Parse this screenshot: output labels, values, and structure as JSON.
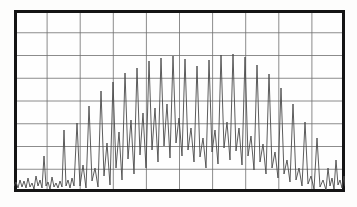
{
  "display": {
    "device_label": "waveform-display",
    "mode": "oscilloscope-trace",
    "background_color": "#fefefe",
    "page_background_color": "#fdfdfc",
    "border_color": "#141414",
    "border_width_px": 3,
    "grid_color": "#6f6f6f",
    "grid_width_px": 0.8,
    "trace_color": "#4a4a4a",
    "trace_width_px": 0.9
  },
  "graticule": {
    "columns": 10,
    "rows": 8,
    "vertical_divisions": 10,
    "horizontal_divisions": 8,
    "show_grid": true,
    "show_border": true,
    "plot_left_px": 14,
    "plot_top_px": 10,
    "plot_width_px": 331,
    "plot_height_px": 182
  },
  "chart_data": {
    "type": "line",
    "title": "",
    "subtitle": "",
    "xlabel": "",
    "ylabel": "",
    "xlim": [
      0,
      331
    ],
    "ylim": [
      0,
      182
    ],
    "grid": true,
    "legend_position": "none",
    "series": [
      {
        "name": "trace",
        "description": "Amplitude-modulated oscillation rising from a noise floor, peaking across the middle of the sweep, then decaying back into the noise floor at the right edge.",
        "baseline_y": 176,
        "points": [
          [
            0,
            176
          ],
          [
            2,
            172
          ],
          [
            4,
            178
          ],
          [
            6,
            170
          ],
          [
            8,
            177
          ],
          [
            10,
            171
          ],
          [
            12,
            178
          ],
          [
            14,
            168
          ],
          [
            16,
            177
          ],
          [
            18,
            173
          ],
          [
            20,
            179
          ],
          [
            22,
            166
          ],
          [
            24,
            176
          ],
          [
            26,
            170
          ],
          [
            28,
            178
          ],
          [
            30,
            146
          ],
          [
            32,
            176
          ],
          [
            34,
            172
          ],
          [
            36,
            179
          ],
          [
            38,
            167
          ],
          [
            40,
            177
          ],
          [
            42,
            173
          ],
          [
            44,
            178
          ],
          [
            46,
            171
          ],
          [
            48,
            177
          ],
          [
            50,
            120
          ],
          [
            52,
            176
          ],
          [
            54,
            170
          ],
          [
            56,
            178
          ],
          [
            58,
            168
          ],
          [
            60,
            176
          ],
          [
            63,
            113
          ],
          [
            66,
            176
          ],
          [
            69,
            155
          ],
          [
            72,
            178
          ],
          [
            75,
            96
          ],
          [
            78,
            171
          ],
          [
            81,
            158
          ],
          [
            84,
            177
          ],
          [
            87,
            81
          ],
          [
            90,
            166
          ],
          [
            93,
            133
          ],
          [
            96,
            175
          ],
          [
            99,
            72
          ],
          [
            102,
            158
          ],
          [
            105,
            122
          ],
          [
            108,
            170
          ],
          [
            111,
            63
          ],
          [
            114,
            149
          ],
          [
            117,
            110
          ],
          [
            120,
            164
          ],
          [
            123,
            58
          ],
          [
            126,
            145
          ],
          [
            129,
            103
          ],
          [
            132,
            158
          ],
          [
            135,
            51
          ],
          [
            138,
            140
          ],
          [
            141,
            98
          ],
          [
            144,
            152
          ],
          [
            147,
            48
          ],
          [
            150,
            136
          ],
          [
            153,
            94
          ],
          [
            156,
            148
          ],
          [
            159,
            46
          ],
          [
            162,
            133
          ],
          [
            165,
            108
          ],
          [
            168,
            146
          ],
          [
            171,
            49
          ],
          [
            174,
            140
          ],
          [
            177,
            118
          ],
          [
            180,
            152
          ],
          [
            183,
            56
          ],
          [
            186,
            147
          ],
          [
            189,
            128
          ],
          [
            192,
            158
          ],
          [
            195,
            50
          ],
          [
            198,
            142
          ],
          [
            201,
            120
          ],
          [
            204,
            154
          ],
          [
            207,
            45
          ],
          [
            210,
            138
          ],
          [
            213,
            112
          ],
          [
            216,
            150
          ],
          [
            219,
            44
          ],
          [
            222,
            141
          ],
          [
            225,
            118
          ],
          [
            228,
            155
          ],
          [
            231,
            47
          ],
          [
            234,
            146
          ],
          [
            237,
            126
          ],
          [
            240,
            160
          ],
          [
            243,
            55
          ],
          [
            246,
            152
          ],
          [
            249,
            134
          ],
          [
            252,
            164
          ],
          [
            255,
            64
          ],
          [
            258,
            158
          ],
          [
            261,
            142
          ],
          [
            264,
            168
          ],
          [
            267,
            78
          ],
          [
            270,
            164
          ],
          [
            273,
            150
          ],
          [
            276,
            172
          ],
          [
            279,
            94
          ],
          [
            282,
            170
          ],
          [
            285,
            158
          ],
          [
            288,
            176
          ],
          [
            291,
            112
          ],
          [
            294,
            174
          ],
          [
            297,
            166
          ],
          [
            300,
            179
          ],
          [
            303,
            128
          ],
          [
            306,
            177
          ],
          [
            309,
            170
          ],
          [
            312,
            180
          ],
          [
            314,
            158
          ],
          [
            316,
            176
          ],
          [
            318,
            168
          ],
          [
            320,
            179
          ],
          [
            322,
            150
          ],
          [
            324,
            175
          ],
          [
            326,
            170
          ],
          [
            328,
            178
          ],
          [
            330,
            166
          ],
          [
            331,
            176
          ]
        ]
      }
    ]
  }
}
